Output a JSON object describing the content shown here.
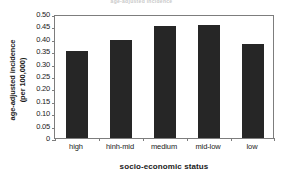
{
  "chart_data": {
    "type": "bar",
    "title": "age-adjusted incidence",
    "categories": [
      "high",
      "hinh-mid",
      "medium",
      "mid-low",
      "low"
    ],
    "values": [
      0.349,
      0.396,
      0.452,
      0.457,
      0.38
    ],
    "series": [
      {
        "name": "age-adjusted incidence (per 100,000)",
        "values": [
          0.349,
          0.396,
          0.452,
          0.457,
          0.38
        ]
      }
    ],
    "xlabel": "socio-economic status",
    "ylabel_line1": "age-adjusted incidence",
    "ylabel_line2": "(per 100,000)",
    "ylim": [
      0,
      0.5
    ],
    "ytick_values": [
      0,
      0.05,
      0.1,
      0.15,
      0.2,
      0.25,
      0.3,
      0.35,
      0.4,
      0.45,
      0.5
    ],
    "ytick_labels": [
      "0",
      "0.05",
      "0.10",
      "0.15",
      "0.20",
      "0.25",
      "0.30",
      "0.35",
      "0.40",
      "0.45",
      "0.50"
    ],
    "grid": false,
    "legend": false,
    "legend_position": "none",
    "bar_color": "#262626",
    "frame_color": "#7d7d7d",
    "background_color": "#ffffff"
  }
}
